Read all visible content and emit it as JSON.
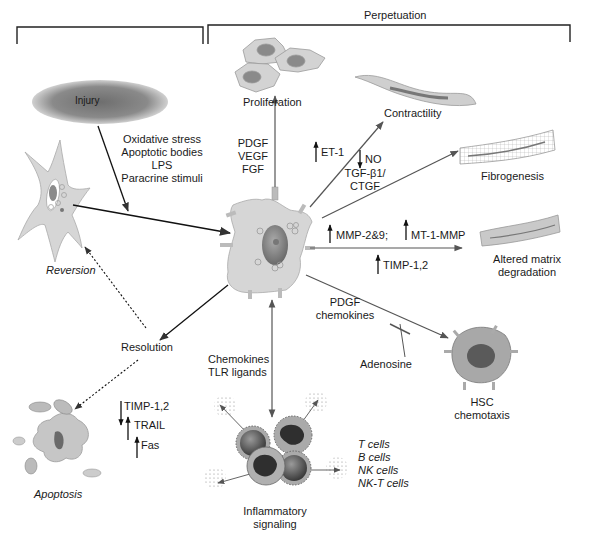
{
  "header": {
    "initiation_label": "",
    "perpetuation_label": "Perpetuation"
  },
  "nodes": {
    "injury": "Injury",
    "proliferation": "Proliferation",
    "contractility": "Contractility",
    "fibrogenesis": "Fibrogenesis",
    "altered_matrix": [
      "Altered matrix",
      "degradation"
    ],
    "hsc_chemotaxis": [
      "HSC",
      "chemotaxis"
    ],
    "inflammatory": [
      "Inflammatory",
      "signaling"
    ],
    "resolution": "Resolution",
    "reversion": "Reversion",
    "apoptosis": "Apoptosis"
  },
  "stimuli": [
    "Oxidative stress",
    "Apoptotic bodies",
    "LPS",
    "Paracrine stimuli"
  ],
  "growth_factors": [
    "PDGF",
    "VEGF",
    "FGF"
  ],
  "mediators": {
    "et1": "ET-1",
    "no": "NO",
    "tgf": [
      "TGF-β1/",
      "CTGF"
    ],
    "mmp": "MMP-2&9;",
    "mt1mmp": "MT-1-MMP",
    "timp_matrix": "TIMP-1,2",
    "pdgf_chemokines": [
      "PDGF",
      "chemokines"
    ],
    "adenosine": "Adenosine",
    "chemokines_tlr": [
      "Chemokines",
      "TLR ligands"
    ]
  },
  "apoptosis_factors": [
    {
      "label": "TIMP-1,2",
      "direction": "down"
    },
    {
      "label": "TRAIL",
      "direction": "up"
    },
    {
      "label": "Fas",
      "direction": "up"
    }
  ],
  "immune_cells": [
    "T cells",
    "B cells",
    "NK cells",
    "NK-T cells"
  ],
  "colors": {
    "cell_fill": "#d6d6d6",
    "cell_stroke": "#9a9a9a",
    "nucleus": "#8a8a8a",
    "arrow": "#555555",
    "injury": "#7a7a7a"
  }
}
